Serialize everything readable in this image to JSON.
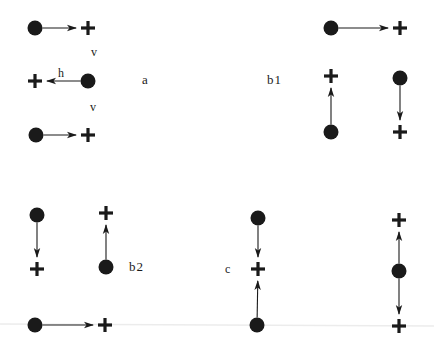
{
  "diagram": {
    "type": "charge-displacement-configurations",
    "colors": {
      "ink": "#1a1a1a",
      "background": "#ffffff"
    },
    "node_kinds": {
      "dot": "filled-circle (negative charge / particle)",
      "plus": "plus sign (positive charge / site)"
    },
    "panels": [
      {
        "id": "a",
        "label": "a",
        "annotations": [
          {
            "text": "v",
            "role": "vertical-spacing-label-1"
          },
          {
            "text": "h",
            "role": "horizontal-displacement-label"
          },
          {
            "text": "v",
            "role": "vertical-spacing-label-2"
          }
        ],
        "pairs": [
          {
            "from": "dot",
            "to": "plus",
            "direction": "right"
          },
          {
            "from": "dot",
            "to": "plus",
            "direction": "left"
          },
          {
            "from": "dot",
            "to": "plus",
            "direction": "right"
          }
        ]
      },
      {
        "id": "b1",
        "label": "b1",
        "pairs": [
          {
            "from": "dot",
            "to": "plus",
            "direction": "right"
          },
          {
            "from": "dot",
            "to": "plus",
            "direction": "up"
          },
          {
            "from": "dot",
            "to": "plus",
            "direction": "down"
          }
        ]
      },
      {
        "id": "b2",
        "label": "b2",
        "pairs": [
          {
            "from": "dot",
            "to": "plus",
            "direction": "down"
          },
          {
            "from": "dot",
            "to": "plus",
            "direction": "up"
          },
          {
            "from": "dot",
            "to": "plus",
            "direction": "right"
          }
        ]
      },
      {
        "id": "c",
        "label": "c",
        "pairs": [
          {
            "from": "dot",
            "to": "plus",
            "direction": "down"
          },
          {
            "from": "dot",
            "to": "plus",
            "direction": "up"
          },
          {
            "from": "dot",
            "to": "plus",
            "direction": "up"
          },
          {
            "from": "dot",
            "to": "plus",
            "direction": "down"
          }
        ]
      }
    ]
  }
}
